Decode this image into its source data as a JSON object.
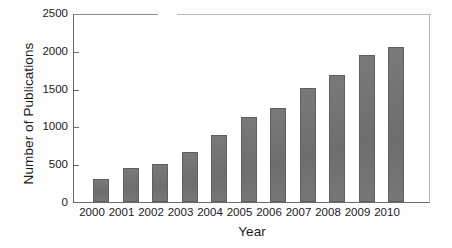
{
  "chart_data": {
    "type": "bar",
    "title": "",
    "xlabel": "Year",
    "ylabel": "Number of Publications",
    "categories": [
      "2000",
      "2001",
      "2002",
      "2003",
      "2004",
      "2005",
      "2006",
      "2007",
      "2008",
      "2009",
      "2010"
    ],
    "values": [
      310,
      450,
      505,
      660,
      880,
      1120,
      1240,
      1510,
      1675,
      1945,
      2050
    ],
    "ylim": [
      0,
      2500
    ],
    "yticks": [
      0,
      500,
      1000,
      1500,
      2000,
      2500
    ],
    "ytick_labels": [
      "0",
      "500",
      "1000",
      "1500",
      "2000",
      "2500"
    ],
    "grid": false,
    "legend": null,
    "bar_color": "#727272",
    "axis_color": "#6a6a6a",
    "background_color": "#ffffff"
  },
  "axes": {
    "y_title": "Number of Publications",
    "x_title": "Year"
  }
}
